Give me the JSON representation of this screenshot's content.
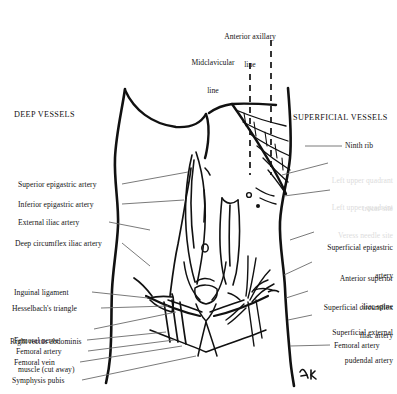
{
  "figure": {
    "title_deep": "DEEP VESSELS",
    "title_superficial": "SUPERFICIAL VESSELS",
    "signature": "A.K.",
    "background_color": "#ffffff",
    "ink_color": "#111111",
    "leader_color": "#6b6b6b",
    "faint_color": "#dcdcdc"
  },
  "top_labels": [
    {
      "id": "anterior-axillary-line",
      "line1": "Anterior axillary",
      "line2": "line"
    },
    {
      "id": "midclavicular-line",
      "line1": "Midclavicular",
      "line2": "line"
    }
  ],
  "left_labels": [
    {
      "id": "superior-epigastric-artery",
      "text": "Superior epigastric artery"
    },
    {
      "id": "inferior-epigastric-artery",
      "text": "Inferior epigastric artery"
    },
    {
      "id": "external-iliac-artery",
      "text": "External iliac artery"
    },
    {
      "id": "deep-circumflex-iliac-artery",
      "text": "Deep circumflex iliac artery"
    },
    {
      "id": "inguinal-ligament",
      "text": "Inguinal ligament"
    },
    {
      "id": "hesselbachs-triangle",
      "text": "Hesselbach's triangle"
    },
    {
      "id": "right-rectus-abdominis-muscle",
      "line1": "Right rectus abdominis",
      "line2": "muscle (cut away)"
    },
    {
      "id": "femoral-nerve",
      "text": "Femoral nerve"
    },
    {
      "id": "femoral-artery",
      "text": "Femoral artery"
    },
    {
      "id": "femoral-vein",
      "text": "Femoral vein"
    },
    {
      "id": "symphysis-pubis",
      "text": "Symphysis pubis"
    }
  ],
  "right_labels": [
    {
      "id": "ninth-rib",
      "text": "Ninth rib",
      "faint": false
    },
    {
      "id": "left-upper-quadrant-trocar-site",
      "line1": "Left upper quadrant",
      "line2": "trocar site",
      "faint": true
    },
    {
      "id": "left-upper-quadrant-veress-needle-site",
      "line1": "Left upper quadrant",
      "line2": "Veress needle site",
      "faint": true
    },
    {
      "id": "superficial-epigastric-artery",
      "line1": "Superficial epigastric",
      "line2": "artery",
      "faint": false
    },
    {
      "id": "anterior-superior-iliac-spine",
      "line1": "Anterior superior",
      "line2": "iliac spine",
      "faint": false
    },
    {
      "id": "superficial-circumflex-iliac-artery",
      "line1": "Superficial circumflex",
      "line2": "iliac artery",
      "faint": false
    },
    {
      "id": "superficial-external-pudendal-artery",
      "line1": "Superficial external",
      "line2": "pudendal artery",
      "faint": false
    },
    {
      "id": "femoral-artery-right",
      "text": "Femoral artery",
      "faint": false
    }
  ]
}
